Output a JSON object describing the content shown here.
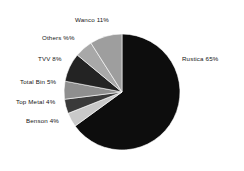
{
  "chart_data": {
    "type": "pie",
    "title": "",
    "subtitle": "",
    "xlabel": "",
    "ylabel": "",
    "legend_position": "none",
    "grid": false,
    "labels_show_percent": true,
    "start_angle_deg": 0,
    "direction": "clockwise",
    "categories": [
      "Rustica",
      "Benson",
      "Top Metal",
      "Total Bin",
      "TVV",
      "Others",
      "Wanco"
    ],
    "values": [
      65,
      4,
      4,
      5,
      8,
      5,
      11
    ],
    "units": "%",
    "colors": [
      "#0d0d0d",
      "#c9c9c9",
      "#3a3a3a",
      "#8f8f8f",
      "#232323",
      "#a8a8a8",
      "#9e9e9e"
    ],
    "slices": [
      {
        "name": "Rustica",
        "value": 65,
        "label": "Rustica 65%",
        "color": "#0d0d0d",
        "start_deg": 0,
        "end_deg": 234,
        "label_x": 182,
        "label_y": 55,
        "label_side": "right"
      },
      {
        "name": "Benson",
        "value": 4,
        "label": "Benson 4%",
        "color": "#c9c9c9",
        "start_deg": 234,
        "end_deg": 248.4,
        "label_x": 26,
        "label_y": 117,
        "label_side": "left"
      },
      {
        "name": "Top Metal",
        "value": 4,
        "label": "Top Metal 4%",
        "color": "#3a3a3a",
        "start_deg": 248.4,
        "end_deg": 262.8,
        "label_x": 16,
        "label_y": 98,
        "label_side": "left"
      },
      {
        "name": "Total Bin",
        "value": 5,
        "label": "Total Bin 5%",
        "color": "#8f8f8f",
        "start_deg": 262.8,
        "end_deg": 280.8,
        "label_x": 20,
        "label_y": 78,
        "label_side": "left"
      },
      {
        "name": "TVV",
        "value": 8,
        "label": "TVV 8%",
        "color": "#232323",
        "start_deg": 280.8,
        "end_deg": 309.6,
        "label_x": 38,
        "label_y": 55,
        "label_side": "left"
      },
      {
        "name": "Others",
        "value": 5,
        "label": "Others %%",
        "color": "#a8a8a8",
        "start_deg": 309.6,
        "end_deg": 327.6,
        "label_x": 42,
        "label_y": 34,
        "label_side": "left"
      },
      {
        "name": "Wanco",
        "value": 11,
        "label": "Wanco 11%",
        "color": "#9e9e9e",
        "start_deg": 327.6,
        "end_deg": 360,
        "label_x": 75,
        "label_y": 16,
        "label_side": "left"
      }
    ],
    "geometry": {
      "center_x": 122,
      "center_y": 92,
      "radius": 58
    }
  }
}
